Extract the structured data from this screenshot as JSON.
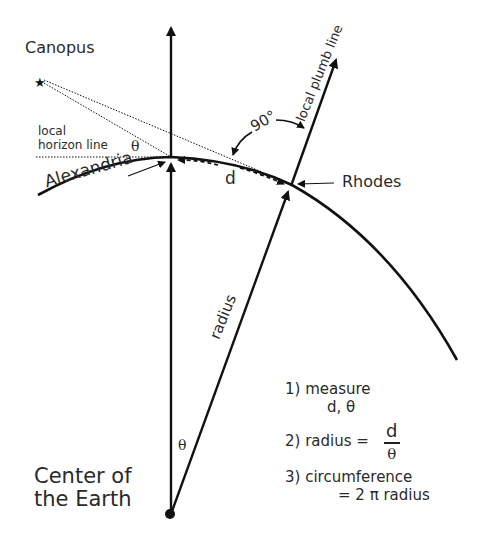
{
  "diagram": {
    "labels": {
      "star": "Canopus",
      "horizon": [
        "local",
        "horizon line"
      ],
      "theta_horizon": "θ",
      "city_a": "Alexandria",
      "city_b": "Rhodes",
      "right_angle": "90°",
      "plumb_line": "local plumb line",
      "arc_distance": "d",
      "radius": "radius",
      "theta_center": "θ",
      "center": [
        "Center of",
        "the Earth"
      ]
    },
    "steps": {
      "step1": "1) measure",
      "step1_values": "d, θ",
      "step2_prefix": "2) radius =",
      "step2_num": "d",
      "step2_den": "θ",
      "step3": "3) circumference",
      "step3_formula": "= 2 π radius"
    },
    "icons": {
      "star": "star-icon",
      "center_point": "dot-icon"
    },
    "colors": {
      "line": "#111111",
      "text": "#2a2a2a",
      "background": "#ffffff"
    }
  }
}
